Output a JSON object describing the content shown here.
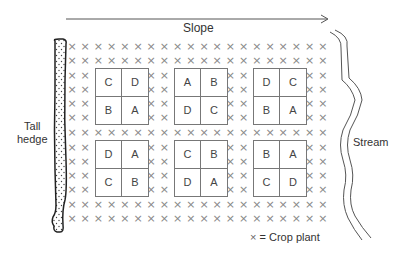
{
  "slope": {
    "label": "Slope"
  },
  "hedge": {
    "label_line1": "Tall",
    "label_line2": "hedge"
  },
  "stream": {
    "label": "Stream"
  },
  "legend": {
    "symbol": "×",
    "text": "= Crop plant"
  },
  "crop_symbol": "×",
  "plots": [
    {
      "id": "top-left",
      "cells": [
        "C",
        "D",
        "B",
        "A"
      ]
    },
    {
      "id": "top-middle",
      "cells": [
        "A",
        "B",
        "D",
        "C"
      ]
    },
    {
      "id": "top-right",
      "cells": [
        "D",
        "C",
        "B",
        "A"
      ]
    },
    {
      "id": "bottom-left",
      "cells": [
        "D",
        "A",
        "C",
        "B"
      ]
    },
    {
      "id": "bottom-middle",
      "cells": [
        "C",
        "B",
        "D",
        "A"
      ]
    },
    {
      "id": "bottom-right",
      "cells": [
        "B",
        "A",
        "C",
        "D"
      ]
    }
  ],
  "colors": {
    "line": "#555555",
    "crop": "#888888",
    "box": "#777777"
  }
}
